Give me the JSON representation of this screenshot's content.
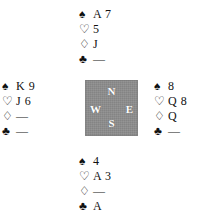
{
  "diagram": {
    "type": "bridge-hand-diagram",
    "background_color": "#ffffff",
    "text_color": "#111111"
  },
  "suits": {
    "spade": {
      "name": "spade-symbol",
      "glyph": "♠",
      "style": "filled"
    },
    "heart": {
      "name": "heart-symbol",
      "glyph": "♡",
      "style": "outline"
    },
    "diamond": {
      "name": "diamond-symbol",
      "glyph": "♢",
      "style": "outline"
    },
    "club": {
      "name": "club-symbol",
      "glyph": "♣",
      "style": "filled"
    },
    "void": "—"
  },
  "compass": {
    "background_color": "#8d8d8d",
    "label_color": "#ffffff",
    "north": "N",
    "west": "W",
    "east": "E",
    "south": "S"
  },
  "hands": {
    "north": {
      "position": "North",
      "spades": "A 7",
      "hearts": "5",
      "diamonds": "J",
      "clubs": "—"
    },
    "west": {
      "position": "West",
      "spades": "K 9",
      "hearts": "J 6",
      "diamonds": "—",
      "clubs": "—"
    },
    "east": {
      "position": "East",
      "spades": "8",
      "hearts": "Q 8",
      "diamonds": "Q",
      "clubs": "—"
    },
    "south": {
      "position": "South",
      "spades": "4",
      "hearts": "A 3",
      "diamonds": "—",
      "clubs": "A"
    }
  }
}
